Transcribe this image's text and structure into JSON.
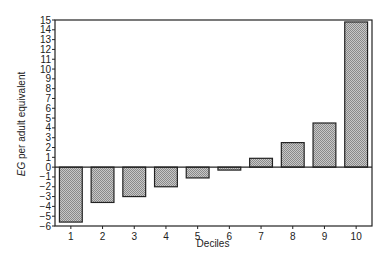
{
  "chart_data": {
    "type": "bar",
    "title": "",
    "xlabel": "Deciles",
    "ylabel_italic": "EG",
    "ylabel_rest": " per adult equivalent",
    "ylabel": "EG per adult equivalent",
    "categories": [
      "1",
      "2",
      "3",
      "4",
      "5",
      "6",
      "7",
      "8",
      "9",
      "10"
    ],
    "values": [
      -5.6,
      -3.6,
      -3.0,
      -2.0,
      -1.1,
      -0.3,
      0.9,
      2.5,
      4.5,
      14.8
    ],
    "ylim": [
      -6,
      15
    ],
    "yticks": [
      15,
      14,
      13,
      12,
      11,
      10,
      9,
      8,
      7,
      6,
      5,
      4,
      3,
      2,
      1,
      0,
      -1,
      -2,
      -3,
      -4,
      -5,
      -6
    ],
    "grid": false,
    "legend": null,
    "bar_fill": "hatched-gray"
  },
  "colors": {
    "bar_fill": "#b5b5b5",
    "bar_stroke": "#222222",
    "axis": "#222222"
  }
}
